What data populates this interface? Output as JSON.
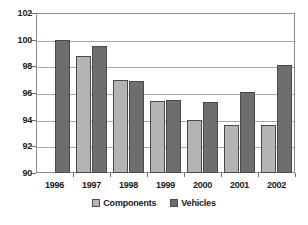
{
  "chart_data": {
    "type": "bar",
    "title": "",
    "subtitle": "",
    "xlabel": "",
    "ylabel": "",
    "categories": [
      "1996",
      "1997",
      "1998",
      "1999",
      "2000",
      "2001",
      "2002"
    ],
    "series": [
      {
        "name": "Components",
        "color": "#b4b4b4",
        "values": [
          null,
          98.8,
          97.0,
          95.4,
          94.0,
          93.6,
          93.6
        ]
      },
      {
        "name": "Vehicles",
        "color": "#6e6e6e",
        "values": [
          100.0,
          99.5,
          96.9,
          95.5,
          95.3,
          96.1,
          98.1
        ]
      }
    ],
    "ylim": [
      90,
      102
    ],
    "ytick_values": [
      90,
      92,
      94,
      96,
      98,
      100,
      102
    ],
    "ytick_labels": [
      "90",
      "92",
      "94",
      "96",
      "98",
      "100",
      "102"
    ],
    "grid": true,
    "legend_position": "bottom",
    "annotations": []
  }
}
